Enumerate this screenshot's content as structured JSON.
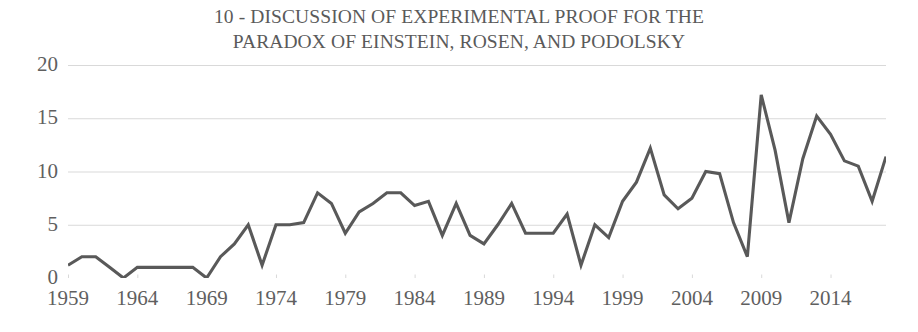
{
  "chart_data": {
    "type": "line",
    "title": "10 - DISCUSSION OF EXPERIMENTAL PROOF FOR THE\nPARADOX OF EINSTEIN, ROSEN, AND PODOLSKY",
    "title_line1": "10 - DISCUSSION OF EXPERIMENTAL PROOF FOR THE",
    "title_line2": "PARADOX OF EINSTEIN, ROSEN, AND PODOLSKY",
    "xlabel": "",
    "ylabel": "",
    "xlim": [
      1959,
      2018
    ],
    "ylim": [
      0,
      20
    ],
    "yticks": [
      0,
      5,
      10,
      15,
      20
    ],
    "ytick_labels": [
      "0",
      "5",
      "10",
      "15",
      "20"
    ],
    "xticks": [
      1959,
      1964,
      1969,
      1974,
      1979,
      1984,
      1989,
      1994,
      1999,
      2004,
      2009,
      2014
    ],
    "xtick_labels": [
      "1959",
      "1964",
      "1969",
      "1974",
      "1979",
      "1984",
      "1989",
      "1994",
      "1999",
      "2004",
      "2009",
      "2014"
    ],
    "grid": "horizontal",
    "legend": "none",
    "line_color": "#595959",
    "grid_color": "#d9d9d9",
    "text_color": "#5f5f5f",
    "series": [
      {
        "name": "Publications",
        "x": [
          1959,
          1960,
          1961,
          1962,
          1963,
          1964,
          1965,
          1966,
          1967,
          1968,
          1969,
          1970,
          1971,
          1972,
          1973,
          1974,
          1975,
          1976,
          1977,
          1978,
          1979,
          1980,
          1981,
          1982,
          1983,
          1984,
          1985,
          1986,
          1987,
          1988,
          1989,
          1990,
          1991,
          1992,
          1993,
          1994,
          1995,
          1996,
          1997,
          1998,
          1999,
          2000,
          2001,
          2002,
          2003,
          2004,
          2005,
          2006,
          2007,
          2008,
          2009,
          2010,
          2011,
          2012,
          2013,
          2014,
          2015,
          2016,
          2017,
          2018
        ],
        "values": [
          1.2,
          2.0,
          2.0,
          1.0,
          0.0,
          1.0,
          1.0,
          1.0,
          1.0,
          1.0,
          0.0,
          2.0,
          3.2,
          5.0,
          1.2,
          5.0,
          5.0,
          5.2,
          8.0,
          7.0,
          4.2,
          6.2,
          7.0,
          8.0,
          8.0,
          6.8,
          7.2,
          4.0,
          7.0,
          4.0,
          3.2,
          5.0,
          7.0,
          4.2,
          4.2,
          4.2,
          6.0,
          1.2,
          5.0,
          3.8,
          7.2,
          9.0,
          12.2,
          7.8,
          6.5,
          7.5,
          10.0,
          9.8,
          5.2,
          2.0,
          17.2,
          12.0,
          5.2,
          11.2,
          15.2,
          13.5,
          11.0,
          10.5,
          7.2,
          11.4
        ]
      }
    ]
  }
}
